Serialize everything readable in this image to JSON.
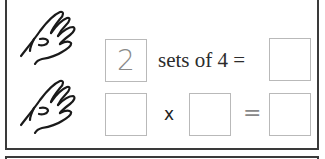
{
  "worksheet": {
    "row1": {
      "first_box_value": "2",
      "text": "sets of 4 =",
      "result_box_value": ""
    },
    "row2": {
      "box_a_value": "",
      "operator": "x",
      "box_b_value": "",
      "equals": "=",
      "result_box_value": ""
    },
    "icons": [
      "hand-icon",
      "hand-icon"
    ]
  },
  "colors": {
    "frame": "#3a3a3a",
    "box_border": "#b9b9b9",
    "digit": "#8a8a8a",
    "text": "#2c2c2c"
  }
}
